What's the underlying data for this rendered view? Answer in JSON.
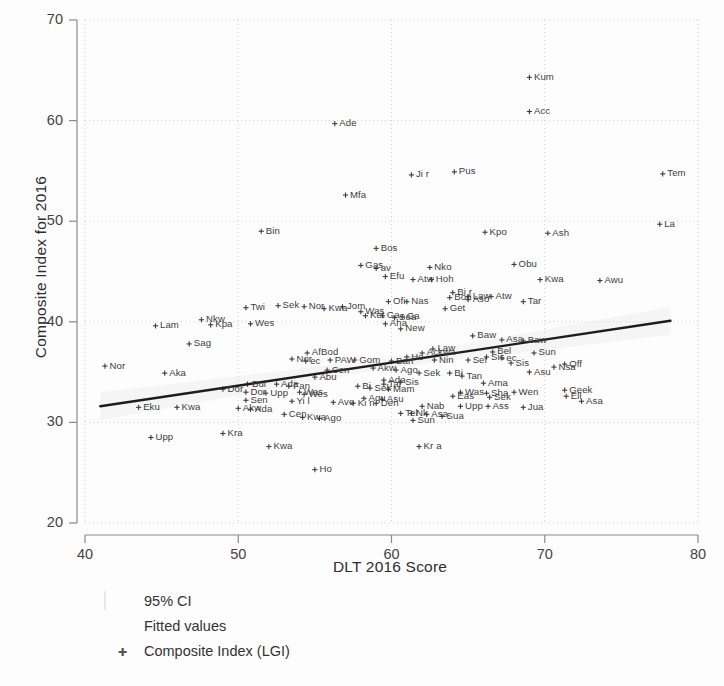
{
  "chart_data": {
    "type": "scatter",
    "title": "",
    "xlabel": "DLT 2016 Score",
    "ylabel": "Composite Index for 2016",
    "xlim": [
      40,
      80
    ],
    "ylim": [
      20,
      70
    ],
    "xticks": [
      40,
      50,
      60,
      70,
      80
    ],
    "yticks": [
      20,
      30,
      40,
      50,
      60,
      70
    ],
    "grid": "dotted",
    "legend_position": "below-axes-left",
    "legend": [
      {
        "key": "ci-swatch",
        "label": "95% CI"
      },
      {
        "key": "fit-line",
        "label": "Fitted values"
      },
      {
        "key": "point-marker",
        "label": "Composite Index (LGI)"
      }
    ],
    "fit_line": {
      "x": [
        41.0,
        78.2
      ],
      "y": [
        31.6,
        40.1
      ],
      "color": "#1d1d1d"
    },
    "series": [
      {
        "name": "Composite Index (LGI)",
        "marker": "+",
        "color": "#3c3c3c",
        "points": [
          {
            "label": "Kum",
            "x": 69.0,
            "y": 64.3
          },
          {
            "label": "Acc",
            "x": 69.0,
            "y": 60.9
          },
          {
            "label": "Ade",
            "x": 56.3,
            "y": 59.7
          },
          {
            "label": "Tem",
            "x": 77.7,
            "y": 54.7
          },
          {
            "label": "Pus",
            "x": 64.1,
            "y": 54.9
          },
          {
            "label": "Ji r",
            "x": 61.3,
            "y": 54.6
          },
          {
            "label": "Mfa",
            "x": 57.0,
            "y": 52.6
          },
          {
            "label": "La",
            "x": 77.5,
            "y": 49.7
          },
          {
            "label": "Bin",
            "x": 51.5,
            "y": 49.0
          },
          {
            "label": "Kpo",
            "x": 66.1,
            "y": 48.9
          },
          {
            "label": "Ash",
            "x": 70.2,
            "y": 48.8
          },
          {
            "label": "Bos",
            "x": 59.0,
            "y": 47.3
          },
          {
            "label": "Obu",
            "x": 68.0,
            "y": 45.7
          },
          {
            "label": "Gas",
            "x": 58.0,
            "y": 45.6
          },
          {
            "label": "av",
            "x": 59.0,
            "y": 45.3
          },
          {
            "label": "Nko",
            "x": 62.5,
            "y": 45.4
          },
          {
            "label": "Efu",
            "x": 59.6,
            "y": 44.5
          },
          {
            "label": "Atw",
            "x": 61.4,
            "y": 44.2
          },
          {
            "label": "Hoh",
            "x": 62.6,
            "y": 44.2
          },
          {
            "label": "Kwa",
            "x": 69.7,
            "y": 44.2
          },
          {
            "label": "Awu",
            "x": 73.6,
            "y": 44.1
          },
          {
            "label": "Bi r",
            "x": 64.0,
            "y": 42.9
          },
          {
            "label": "Law",
            "x": 65.0,
            "y": 42.5
          },
          {
            "label": "Bon",
            "x": 63.8,
            "y": 42.4
          },
          {
            "label": "Aso",
            "x": 65.0,
            "y": 42.2
          },
          {
            "label": "Atw",
            "x": 66.5,
            "y": 42.5
          },
          {
            "label": "Nas",
            "x": 61.0,
            "y": 42.0
          },
          {
            "label": "Ofi",
            "x": 59.8,
            "y": 42.0
          },
          {
            "label": "Jom",
            "x": 56.8,
            "y": 41.5
          },
          {
            "label": "Sek",
            "x": 52.6,
            "y": 41.6
          },
          {
            "label": "Nor",
            "x": 54.3,
            "y": 41.5
          },
          {
            "label": "Kwa",
            "x": 55.6,
            "y": 41.3
          },
          {
            "label": "Twi",
            "x": 50.5,
            "y": 41.4
          },
          {
            "label": "Tar",
            "x": 68.6,
            "y": 42.0
          },
          {
            "label": "Was",
            "x": 58.0,
            "y": 41.0
          },
          {
            "label": "Ket",
            "x": 58.3,
            "y": 40.6
          },
          {
            "label": "Ga",
            "x": 59.4,
            "y": 40.6
          },
          {
            "label": "Get",
            "x": 63.5,
            "y": 41.3
          },
          {
            "label": "Ga",
            "x": 60.7,
            "y": 40.5
          },
          {
            "label": "Sea",
            "x": 60.2,
            "y": 40.4
          },
          {
            "label": "Nkw",
            "x": 47.6,
            "y": 40.2
          },
          {
            "label": "Wes",
            "x": 50.8,
            "y": 39.8
          },
          {
            "label": "Kpa",
            "x": 48.2,
            "y": 39.7
          },
          {
            "label": "Lam",
            "x": 44.6,
            "y": 39.6
          },
          {
            "label": "Aha",
            "x": 59.6,
            "y": 39.8
          },
          {
            "label": "New",
            "x": 60.6,
            "y": 39.3
          },
          {
            "label": "Baw",
            "x": 65.3,
            "y": 38.6
          },
          {
            "label": "Sag",
            "x": 46.8,
            "y": 37.8
          },
          {
            "label": "AfBod",
            "x": 54.5,
            "y": 36.9
          },
          {
            "label": "Nor",
            "x": 53.5,
            "y": 36.3
          },
          {
            "label": "ec",
            "x": 54.4,
            "y": 36.1
          },
          {
            "label": "PAW",
            "x": 56.0,
            "y": 36.2
          },
          {
            "label": "Gom",
            "x": 57.6,
            "y": 36.2
          },
          {
            "label": "Asa",
            "x": 67.2,
            "y": 38.2
          },
          {
            "label": "Baw",
            "x": 68.6,
            "y": 38.1
          },
          {
            "label": "Law",
            "x": 62.7,
            "y": 37.3
          },
          {
            "label": "Ackwa",
            "x": 62.0,
            "y": 36.9
          },
          {
            "label": "Bel",
            "x": 66.6,
            "y": 37.0
          },
          {
            "label": "Sun",
            "x": 69.3,
            "y": 36.9
          },
          {
            "label": "Sis",
            "x": 66.2,
            "y": 36.5
          },
          {
            "label": "ec",
            "x": 67.2,
            "y": 36.4
          },
          {
            "label": "Ho",
            "x": 61.0,
            "y": 36.5
          },
          {
            "label": "Ban",
            "x": 60.0,
            "y": 36.1
          },
          {
            "label": "Nin",
            "x": 62.8,
            "y": 36.2
          },
          {
            "label": "Sef",
            "x": 65.0,
            "y": 36.2
          },
          {
            "label": "Sis",
            "x": 67.8,
            "y": 35.9
          },
          {
            "label": "Off",
            "x": 71.3,
            "y": 35.8
          },
          {
            "label": "Nsa",
            "x": 70.6,
            "y": 35.5
          },
          {
            "label": "Akw",
            "x": 58.8,
            "y": 35.4
          },
          {
            "label": "Cen",
            "x": 55.8,
            "y": 35.2
          },
          {
            "label": "Ago",
            "x": 60.3,
            "y": 35.2
          },
          {
            "label": "Aka",
            "x": 45.2,
            "y": 34.9
          },
          {
            "label": "Nor",
            "x": 41.3,
            "y": 35.6
          },
          {
            "label": "Asu",
            "x": 69.0,
            "y": 35.0
          },
          {
            "label": "Sek",
            "x": 61.8,
            "y": 34.9
          },
          {
            "label": "Bi",
            "x": 63.8,
            "y": 34.9
          },
          {
            "label": "Tan",
            "x": 64.6,
            "y": 34.6
          },
          {
            "label": "Abu",
            "x": 55.0,
            "y": 34.5
          },
          {
            "label": "Ada",
            "x": 52.5,
            "y": 33.8
          },
          {
            "label": "Ada",
            "x": 59.5,
            "y": 34.2
          },
          {
            "label": "Sis",
            "x": 60.6,
            "y": 34.0
          },
          {
            "label": "Tai",
            "x": 59.5,
            "y": 33.8
          },
          {
            "label": "Bul",
            "x": 50.6,
            "y": 33.8
          },
          {
            "label": "Fan",
            "x": 53.3,
            "y": 33.6
          },
          {
            "label": "Bi",
            "x": 57.8,
            "y": 33.6
          },
          {
            "label": "Sek",
            "x": 58.6,
            "y": 33.4
          },
          {
            "label": "Mam",
            "x": 59.8,
            "y": 33.3
          },
          {
            "label": "Ama",
            "x": 66.0,
            "y": 33.9
          },
          {
            "label": "Dor",
            "x": 49.0,
            "y": 33.3
          },
          {
            "label": "Dor",
            "x": 50.5,
            "y": 33.0
          },
          {
            "label": "Upp",
            "x": 51.8,
            "y": 32.9
          },
          {
            "label": "Was",
            "x": 54.0,
            "y": 33.0
          },
          {
            "label": "Wes",
            "x": 54.3,
            "y": 32.8
          },
          {
            "label": "Was",
            "x": 64.5,
            "y": 33.0
          },
          {
            "label": "Sha",
            "x": 66.2,
            "y": 32.9
          },
          {
            "label": "Wen",
            "x": 68.0,
            "y": 33.0
          },
          {
            "label": "Eas",
            "x": 64.0,
            "y": 32.6
          },
          {
            "label": "Sek",
            "x": 66.4,
            "y": 32.5
          },
          {
            "label": "Geek",
            "x": 71.3,
            "y": 33.2
          },
          {
            "label": "Ell",
            "x": 71.4,
            "y": 32.6
          },
          {
            "label": "Asa",
            "x": 72.4,
            "y": 32.1
          },
          {
            "label": "Aqu",
            "x": 58.2,
            "y": 32.4
          },
          {
            "label": "Asu",
            "x": 59.4,
            "y": 32.3
          },
          {
            "label": "Sen",
            "x": 50.5,
            "y": 32.2
          },
          {
            "label": "Yi l",
            "x": 53.5,
            "y": 32.1
          },
          {
            "label": "Ave",
            "x": 56.2,
            "y": 32.0
          },
          {
            "label": "Ki n",
            "x": 57.5,
            "y": 31.9
          },
          {
            "label": "Den",
            "x": 59.0,
            "y": 31.9
          },
          {
            "label": "Eku",
            "x": 43.5,
            "y": 31.5
          },
          {
            "label": "Kwa",
            "x": 46.0,
            "y": 31.5
          },
          {
            "label": "Akw",
            "x": 50.0,
            "y": 31.4
          },
          {
            "label": "Ada",
            "x": 50.8,
            "y": 31.3
          },
          {
            "label": "Nab",
            "x": 62.0,
            "y": 31.6
          },
          {
            "label": "Upp",
            "x": 64.5,
            "y": 31.6
          },
          {
            "label": "Ass",
            "x": 66.3,
            "y": 31.6
          },
          {
            "label": "Jua",
            "x": 68.6,
            "y": 31.5
          },
          {
            "label": "Tel",
            "x": 60.6,
            "y": 30.9
          },
          {
            "label": "Nk",
            "x": 61.3,
            "y": 30.9
          },
          {
            "label": "Asa",
            "x": 62.3,
            "y": 30.8
          },
          {
            "label": "Sua",
            "x": 63.3,
            "y": 30.6
          },
          {
            "label": "Cen",
            "x": 53.0,
            "y": 30.8
          },
          {
            "label": "Kwa",
            "x": 54.2,
            "y": 30.5
          },
          {
            "label": "Ago",
            "x": 55.3,
            "y": 30.4
          },
          {
            "label": "Sun",
            "x": 61.4,
            "y": 30.2
          },
          {
            "label": "Kra",
            "x": 49.0,
            "y": 28.9
          },
          {
            "label": "Upp",
            "x": 44.3,
            "y": 28.5
          },
          {
            "label": "Kwa",
            "x": 52.0,
            "y": 27.6
          },
          {
            "label": "Kr a",
            "x": 61.8,
            "y": 27.6
          },
          {
            "label": "Ho",
            "x": 55.0,
            "y": 25.3
          }
        ]
      }
    ]
  },
  "axes": {
    "y_title": "Composite Index for 2016",
    "x_title": "DLT 2016 Score"
  }
}
